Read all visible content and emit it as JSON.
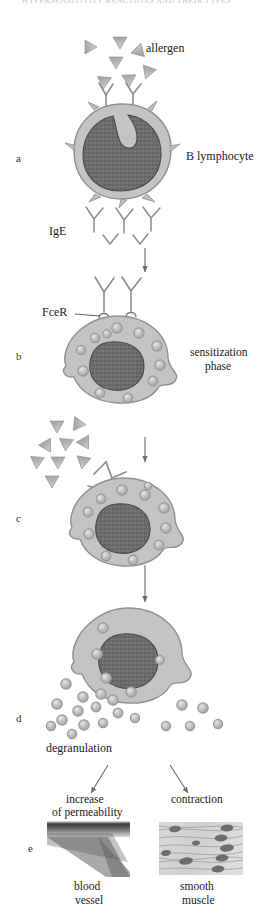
{
  "figure": {
    "title_fragment": "HYPERSENSITIVITY REACTIONS AND THEIR TYPES",
    "type": "biology-diagram"
  },
  "colors": {
    "cytoplasm": "#c4c4c4",
    "cytoplasm_edge": "#8f8f8f",
    "nucleus": "#6e6e6e",
    "nucleus_edge": "#4a4a4a",
    "granule_fill": "#b5b5b5",
    "granule_ring": "#e2e2e2",
    "allergen": "#b9b9b9",
    "allergen_edge": "#8a8a8a",
    "antibody": "#efefef",
    "antibody_edge": "#8c8c8c",
    "arrow": "#6b6b6b",
    "text": "#1a1a1a"
  },
  "panels": [
    {
      "letter": "a",
      "caption": "B lymphocyte"
    },
    {
      "letter": "b",
      "caption_line1": "sensitization",
      "caption_line2": "phase"
    },
    {
      "letter": "c",
      "caption": ""
    },
    {
      "letter": "d",
      "caption": "degranulation"
    },
    {
      "letter": "e",
      "caption": ""
    }
  ],
  "labels": {
    "allergen": "allergen",
    "b_lymphocyte": "B lymphocyte",
    "ige": "IgE",
    "fcer": "FceR",
    "sensitization_line1": "sensitization",
    "sensitization_line2": "phase",
    "degranulation": "degranulation",
    "increase_line1": "increase",
    "increase_line2": "of permeability",
    "contraction": "contraction",
    "blood_line1": "blood",
    "blood_line2": "vessel",
    "muscle_line1": "smooth",
    "muscle_line2": "muscle"
  },
  "counts": {
    "allergens_top": 7,
    "allergens_panel_c": 9,
    "ige_free": 3,
    "receptors_panel_b": 2,
    "granules_panel_b": 11,
    "granules_panel_c": 11,
    "released_granules": 18
  },
  "tissues": [
    {
      "name": "blood vessel",
      "label_line1": "blood",
      "label_line2": "vessel",
      "effect": "increase of permeability"
    },
    {
      "name": "smooth muscle",
      "label_line1": "smooth",
      "label_line2": "muscle",
      "effect": "contraction"
    }
  ]
}
